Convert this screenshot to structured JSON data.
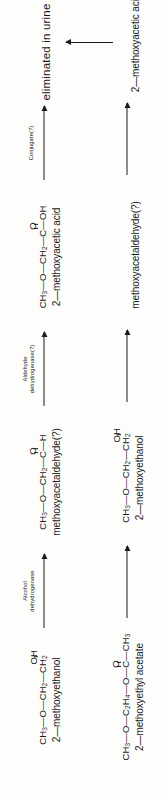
{
  "diagram": {
    "orientation": "rotated-90-ccw",
    "ink_color": "#1a1a1a",
    "background_color": "#fdfdfb"
  },
  "pathways": [
    {
      "id": "acid-chain",
      "nodes": [
        {
          "id": "methoxyethanol-1",
          "formula_parts": [
            "CH",
            "3",
            "—O—CH",
            "2",
            "—CH",
            "2"
          ],
          "substituent": "OH",
          "substituent_bond": "single",
          "name": "2—methoxyethanol"
        },
        {
          "id": "methoxyacetaldehyde",
          "formula_parts": [
            "CH",
            "3",
            "—O—CH",
            "2",
            "—C—H"
          ],
          "substituent": "O",
          "substituent_bond": "double",
          "name": "methoxyacetaldehyde(?)"
        },
        {
          "id": "methoxyacetic-acid",
          "formula_parts": [
            "CH",
            "3",
            "—O—CH",
            "2",
            "—C—OH"
          ],
          "substituent": "O",
          "substituent_bond": "double",
          "name": "2—methoxyacetic acid"
        },
        {
          "id": "eliminated-urine",
          "name": "eliminated in urine"
        }
      ],
      "arrows": [
        {
          "id": "arrow-alcohol-dehydrogenase",
          "label": [
            "Alcohol",
            "dehydrogenase"
          ]
        },
        {
          "id": "arrow-aldehyde-dehydrogenase",
          "label": [
            "Aldehyde",
            "dehydrogenase(?)"
          ]
        },
        {
          "id": "arrow-conjugate",
          "label": [
            "Conjugate(?)"
          ]
        }
      ]
    },
    {
      "id": "acetate-chain",
      "nodes": [
        {
          "id": "methoxyethyl-acetate",
          "formula_parts": [
            "CH",
            "3",
            "—O—C",
            "2",
            "H",
            "4",
            "—O—C—CH",
            "3"
          ],
          "substituent": "O",
          "substituent_bond": "double",
          "name": "2—methoxyethyl acetate"
        },
        {
          "id": "methoxyethanol-2",
          "formula_parts": [
            "CH",
            "3",
            "—O—CH",
            "2",
            "—CH",
            "2"
          ],
          "substituent": "OH",
          "substituent_bond": "single",
          "name": "2—methoxyethanol"
        },
        {
          "id": "methoxyacetaldehyde-2",
          "name": "methoxyacetaldehyde(?)"
        },
        {
          "id": "methoxyacetic-acid-2",
          "name": "2—methoxyacetic acid"
        }
      ],
      "arrows": [
        {
          "id": "arrow-esterase",
          "label": []
        },
        {
          "id": "arrow-oxidation-1",
          "label": []
        },
        {
          "id": "arrow-oxidation-2",
          "label": []
        }
      ]
    }
  ],
  "cross_arrow": {
    "id": "arrow-acid-to-urine",
    "from": "methoxyacetic-acid-2",
    "to": "eliminated-urine",
    "label": ""
  }
}
